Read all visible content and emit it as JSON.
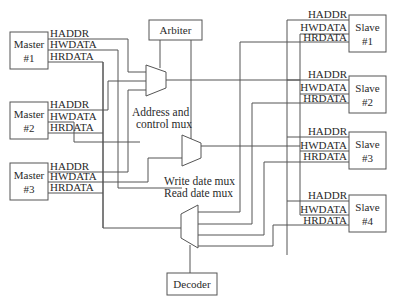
{
  "diagram": {
    "masters": [
      {
        "name": "Master",
        "num": "#1"
      },
      {
        "name": "Master",
        "num": "#2"
      },
      {
        "name": "Master",
        "num": "#3"
      }
    ],
    "slaves": [
      {
        "name": "Slave",
        "num": "#1"
      },
      {
        "name": "Slave",
        "num": "#2"
      },
      {
        "name": "Slave",
        "num": "#3"
      },
      {
        "name": "Slave",
        "num": "#4"
      }
    ],
    "signals": {
      "haddr": "HADDR",
      "hwdata": "HWDATA",
      "hrdata": "HRDATA"
    },
    "arbiter": "Arbiter",
    "decoder": "Decoder",
    "captions": {
      "addr_mux_line1": "Address and",
      "addr_mux_line2": "control mux",
      "data_mux_line1": "Write date mux",
      "data_mux_line2": "Read date mux"
    },
    "colors": {
      "line": "#555555",
      "text": "#2a2a2a",
      "background": "#ffffff"
    }
  }
}
